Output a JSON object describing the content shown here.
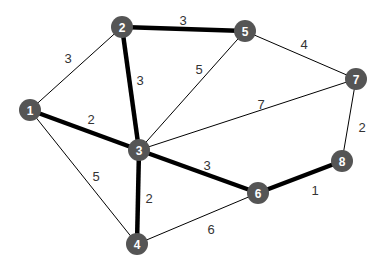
{
  "graph": {
    "node_color": "#555555",
    "node_radius": 11,
    "edge_color": "#000000",
    "thin_width": 1,
    "thick_width": 4.5,
    "nodes": [
      {
        "id": "1",
        "x": 30,
        "y": 110
      },
      {
        "id": "2",
        "x": 122,
        "y": 27
      },
      {
        "id": "3",
        "x": 139,
        "y": 150
      },
      {
        "id": "4",
        "x": 137,
        "y": 244
      },
      {
        "id": "5",
        "x": 245,
        "y": 31
      },
      {
        "id": "6",
        "x": 258,
        "y": 193
      },
      {
        "id": "7",
        "x": 356,
        "y": 79
      },
      {
        "id": "8",
        "x": 342,
        "y": 161
      }
    ],
    "edges": [
      {
        "from": "1",
        "to": "2",
        "weight": "3",
        "thick": false,
        "lx": 68,
        "ly": 58
      },
      {
        "from": "2",
        "to": "5",
        "weight": "3",
        "thick": true,
        "lx": 183,
        "ly": 20
      },
      {
        "from": "2",
        "to": "3",
        "weight": "3",
        "thick": true,
        "lx": 140,
        "ly": 80
      },
      {
        "from": "1",
        "to": "3",
        "weight": "2",
        "thick": true,
        "lx": 91,
        "ly": 119
      },
      {
        "from": "3",
        "to": "5",
        "weight": "5",
        "thick": false,
        "lx": 199,
        "ly": 69
      },
      {
        "from": "5",
        "to": "7",
        "weight": "4",
        "thick": false,
        "lx": 304,
        "ly": 44
      },
      {
        "from": "3",
        "to": "7",
        "weight": "7",
        "thick": false,
        "lx": 261,
        "ly": 104
      },
      {
        "from": "7",
        "to": "8",
        "weight": "2",
        "thick": false,
        "lx": 362,
        "ly": 127
      },
      {
        "from": "1",
        "to": "4",
        "weight": "5",
        "thick": false,
        "lx": 96,
        "ly": 176
      },
      {
        "from": "3",
        "to": "4",
        "weight": "2",
        "thick": true,
        "lx": 149,
        "ly": 198
      },
      {
        "from": "3",
        "to": "6",
        "weight": "3",
        "thick": true,
        "lx": 207,
        "ly": 165
      },
      {
        "from": "4",
        "to": "6",
        "weight": "6",
        "thick": false,
        "lx": 211,
        "ly": 229
      },
      {
        "from": "6",
        "to": "8",
        "weight": "1",
        "thick": true,
        "lx": 315,
        "ly": 190
      }
    ]
  }
}
